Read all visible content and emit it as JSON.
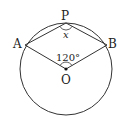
{
  "diagram": {
    "type": "circle-geometry",
    "circle": {
      "cx": 66,
      "cy": 69,
      "r": 46
    },
    "points": {
      "P": {
        "label": "P",
        "x": 66,
        "y": 23
      },
      "A": {
        "label": "A",
        "x": 25,
        "y": 45
      },
      "B": {
        "label": "B",
        "x": 107,
        "y": 45
      },
      "O": {
        "label": "O",
        "x": 66,
        "y": 69
      }
    },
    "angles": {
      "central": {
        "label": "120°",
        "vertex": "O"
      },
      "inscribed": {
        "label": "x",
        "vertex": "P"
      }
    },
    "colors": {
      "stroke": "#333333",
      "text": "#222222",
      "background": "#ffffff"
    }
  }
}
